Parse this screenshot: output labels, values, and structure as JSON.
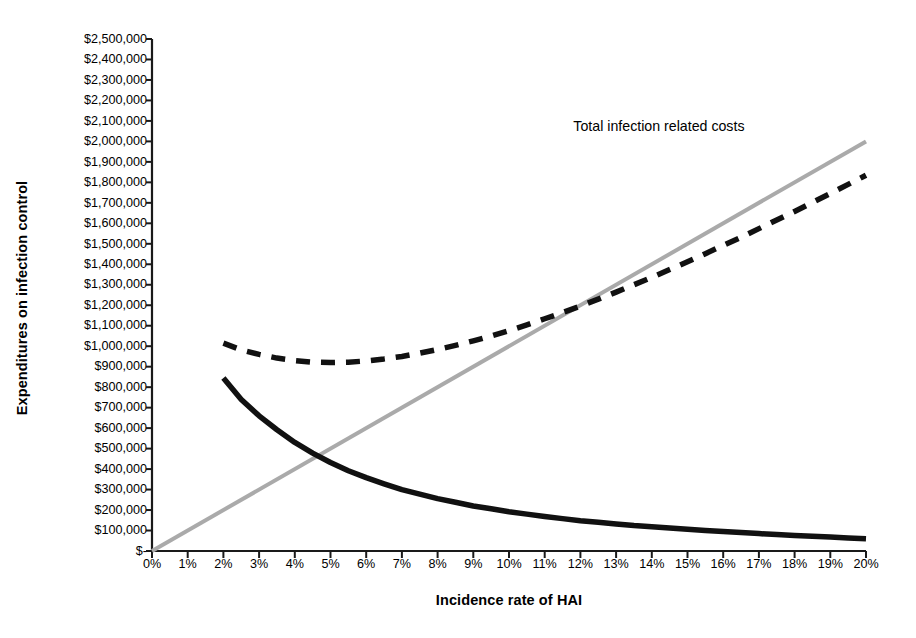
{
  "chart_data": {
    "type": "line",
    "title": "",
    "xlabel": "Incidence rate of HAI",
    "ylabel": "Expenditures on infection control",
    "xlim": [
      0,
      20
    ],
    "ylim": [
      0,
      2500000
    ],
    "grid": false,
    "legend_position": "none",
    "x_tick_labels": [
      "0%",
      "1%",
      "2%",
      "3%",
      "4%",
      "5%",
      "6%",
      "7%",
      "8%",
      "9%",
      "10%",
      "11%",
      "12%",
      "13%",
      "14%",
      "15%",
      "16%",
      "17%",
      "18%",
      "19%",
      "20%"
    ],
    "x_tick_values": [
      0,
      1,
      2,
      3,
      4,
      5,
      6,
      7,
      8,
      9,
      10,
      11,
      12,
      13,
      14,
      15,
      16,
      17,
      18,
      19,
      20
    ],
    "y_tick_labels": [
      "$-",
      "$100,000",
      "$200,000",
      "$300,000",
      "$400,000",
      "$500,000",
      "$600,000",
      "$700,000",
      "$800,000",
      "$900,000",
      "$1,000,000",
      "$1,100,000",
      "$1,200,000",
      "$1,300,000",
      "$1,400,000",
      "$1,500,000",
      "$1,600,000",
      "$1,700,000",
      "$1,800,000",
      "$1,900,000",
      "$2,000,000",
      "$2,100,000",
      "$2,200,000",
      "$2,300,000",
      "$2,400,000",
      "$2,500,000"
    ],
    "y_tick_values": [
      0,
      100000,
      200000,
      300000,
      400000,
      500000,
      600000,
      700000,
      800000,
      900000,
      1000000,
      1100000,
      1200000,
      1300000,
      1400000,
      1500000,
      1600000,
      1700000,
      1800000,
      1900000,
      2000000,
      2100000,
      2200000,
      2300000,
      2400000,
      2500000
    ],
    "annotations": [
      {
        "text": "Total infection related costs",
        "x": 14.2,
        "y": 2070000,
        "name": "total-cost-annotation"
      }
    ],
    "series": [
      {
        "name": "Total costs",
        "style": "dashed",
        "color": "#111111",
        "width": 5.5,
        "x": [
          2,
          2.5,
          3,
          3.5,
          4,
          4.5,
          5,
          5.5,
          6,
          6.5,
          7,
          7.5,
          8,
          8.5,
          9,
          9.5,
          10,
          10.5,
          11,
          11.5,
          12,
          12.5,
          13,
          13.5,
          14,
          14.5,
          15,
          15.5,
          16,
          16.5,
          17,
          17.5,
          18,
          18.5,
          19,
          19.5,
          20
        ],
        "values": [
          1015000,
          982000,
          960000,
          942000,
          930000,
          922000,
          920000,
          922000,
          928000,
          938000,
          950000,
          966000,
          984000,
          1004000,
          1026000,
          1050000,
          1076000,
          1104000,
          1134000,
          1164000,
          1196000,
          1230000,
          1264000,
          1300000,
          1336000,
          1374000,
          1412000,
          1452000,
          1492000,
          1532000,
          1574000,
          1616000,
          1658000,
          1702000,
          1746000,
          1790000,
          1835000
        ]
      },
      {
        "name": "Infection related costs",
        "style": "solid-gray",
        "color": "#aaaaaa",
        "width": 4,
        "x": [
          0,
          20
        ],
        "values": [
          0,
          2000000
        ]
      },
      {
        "name": "Expenditures on infection control",
        "style": "solid-black",
        "color": "#111111",
        "width": 5.5,
        "x": [
          2,
          2.5,
          3,
          3.5,
          4,
          4.5,
          5,
          5.5,
          6,
          6.5,
          7,
          7.5,
          8,
          8.5,
          9,
          9.5,
          10,
          10.5,
          11,
          11.5,
          12,
          12.5,
          13,
          13.5,
          14,
          14.5,
          15,
          15.5,
          16,
          16.5,
          17,
          17.5,
          18,
          18.5,
          19,
          19.5,
          20
        ],
        "values": [
          845000,
          740000,
          660000,
          592000,
          530000,
          478000,
          432000,
          392000,
          358000,
          328000,
          300000,
          278000,
          256000,
          238000,
          220000,
          206000,
          192000,
          180000,
          168000,
          158000,
          148000,
          140000,
          132000,
          124000,
          118000,
          112000,
          106000,
          100000,
          95000,
          90000,
          85000,
          80000,
          76000,
          72000,
          68000,
          64000,
          60000
        ]
      }
    ]
  },
  "layout": {
    "plot_left": 152,
    "plot_right": 866,
    "plot_top": 39,
    "plot_bottom": 551
  }
}
